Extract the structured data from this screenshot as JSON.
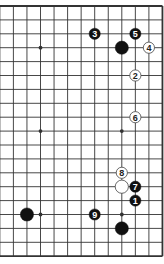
{
  "diagram": {
    "type": "go-board-fragment",
    "board_size": 19,
    "visible_columns": [
      8,
      19
    ],
    "visible_rows": [
      1,
      19
    ],
    "colors": {
      "line": "#333333",
      "black_stone": "#111111",
      "white_stone": "#ffffff",
      "background": "#ffffff"
    },
    "star_points": [
      {
        "col": 10,
        "row": 4
      },
      {
        "col": 16,
        "row": 4
      },
      {
        "col": 10,
        "row": 10
      },
      {
        "col": 16,
        "row": 10
      },
      {
        "col": 10,
        "row": 16
      },
      {
        "col": 16,
        "row": 16
      }
    ],
    "stones": [
      {
        "color": "black",
        "col": 16,
        "row": 4,
        "label": ""
      },
      {
        "color": "black",
        "col": 9,
        "row": 16,
        "label": ""
      },
      {
        "color": "black",
        "col": 16,
        "row": 17,
        "label": ""
      },
      {
        "color": "white",
        "col": 16,
        "row": 14,
        "label": ""
      },
      {
        "color": "black",
        "col": 17,
        "row": 15,
        "label": "1"
      },
      {
        "color": "white",
        "col": 17,
        "row": 6,
        "label": "2"
      },
      {
        "color": "black",
        "col": 14,
        "row": 3,
        "label": "3"
      },
      {
        "color": "white",
        "col": 18,
        "row": 4,
        "label": "4"
      },
      {
        "color": "black",
        "col": 17,
        "row": 3,
        "label": "5"
      },
      {
        "color": "white",
        "col": 17,
        "row": 9,
        "label": "6"
      },
      {
        "color": "black",
        "col": 17,
        "row": 14,
        "label": "7"
      },
      {
        "color": "white",
        "col": 16,
        "row": 13,
        "label": "8"
      },
      {
        "color": "black",
        "col": 14,
        "row": 16,
        "label": "9"
      }
    ]
  }
}
